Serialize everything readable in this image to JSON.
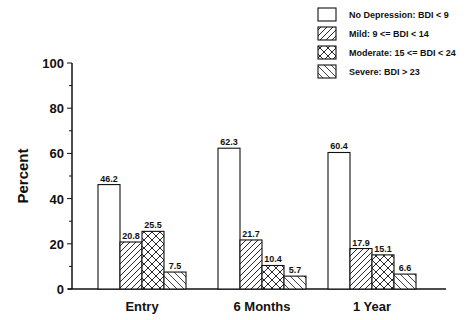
{
  "chart_data": {
    "type": "bar",
    "title": "",
    "xlabel": "",
    "ylabel": "Percent",
    "ylim": [
      0,
      100
    ],
    "yticks": [
      0,
      20,
      40,
      60,
      80,
      100
    ],
    "grid": false,
    "legend_position": "top-right",
    "categories": [
      "Entry",
      "6 Months",
      "1 Year"
    ],
    "series": [
      {
        "name": "No Depression: BDI < 9",
        "pattern": "none",
        "values": [
          46.2,
          62.3,
          60.4
        ]
      },
      {
        "name": "Mild: 9 <= BDI < 14",
        "pattern": "forward-diagonal",
        "values": [
          20.8,
          21.7,
          17.9
        ]
      },
      {
        "name": "Moderate: 15 <= BDI < 24",
        "pattern": "crosshatch",
        "values": [
          25.5,
          10.4,
          15.1
        ]
      },
      {
        "name": "Severe: BDI > 23",
        "pattern": "backward-diagonal",
        "values": [
          7.5,
          5.7,
          6.6
        ]
      }
    ],
    "labels": [
      [
        "46.2",
        "20.8",
        "25.5",
        "7.5"
      ],
      [
        "62.3",
        "21.7",
        "10.4",
        "5.7"
      ],
      [
        "60.4",
        "17.9",
        "15.1",
        "6.6"
      ]
    ]
  }
}
